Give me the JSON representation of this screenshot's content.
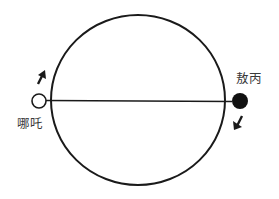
{
  "diagram": {
    "type": "circular-track",
    "track": {
      "shape": "circle",
      "center": [
        138,
        100
      ],
      "rx": 87,
      "ry": 85,
      "stroke": "#1a1a1a",
      "has_diameter": true
    },
    "nodes": [
      {
        "id": "left",
        "label": "哪吒",
        "fill": "hollow",
        "position": "left end of diameter",
        "direction": "up (counterclockwise along top)",
        "arrow": "up-right"
      },
      {
        "id": "right",
        "label": "敖丙",
        "fill": "solid",
        "position": "right end of diameter",
        "direction": "down (counterclockwise along bottom)",
        "arrow": "down-left"
      }
    ]
  },
  "labels": {
    "left": "哪吒",
    "right": "敖丙"
  },
  "colors": {
    "stroke": "#1a1a1a",
    "text": "#3a3a3a",
    "background": "#ffffff"
  }
}
